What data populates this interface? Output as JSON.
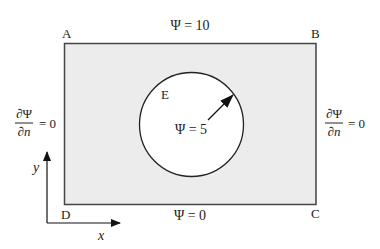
{
  "diagram": {
    "corners": {
      "A": "A",
      "B": "B",
      "C": "C",
      "D": "D"
    },
    "region_label": "E",
    "boundaries": {
      "top": "Ψ = 10",
      "bottom": "Ψ = 0",
      "inner_circle": "Ψ = 5",
      "left": {
        "numerator": "∂Ψ",
        "denominator": "∂n",
        "rhs": "= 0"
      },
      "right": {
        "numerator": "∂Ψ",
        "denominator": "∂n",
        "rhs": "= 0"
      }
    },
    "axes": {
      "x": "x",
      "y": "y"
    },
    "colors": {
      "domain_fill": "#ececec",
      "stroke": "#333333",
      "circle_fill": "#ffffff"
    }
  }
}
